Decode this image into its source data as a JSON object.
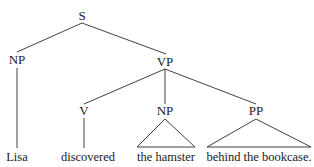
{
  "diagram": {
    "type": "syntax-tree",
    "sentence": "Lisa discovered the hamster behind the bookcase.",
    "background_color": "#ffffff",
    "line_color": "#2b2b2b",
    "text_color": "#1a1a1a"
  },
  "nodes": {
    "s": {
      "label": "S",
      "x": 82,
      "y": 20
    },
    "np_subject": {
      "label": "NP",
      "x": 17,
      "y": 64
    },
    "vp": {
      "label": "VP",
      "x": 165,
      "y": 66
    },
    "v": {
      "label": "V",
      "x": 84,
      "y": 115
    },
    "np_object": {
      "label": "NP",
      "x": 165,
      "y": 115
    },
    "pp": {
      "label": "PP",
      "x": 256,
      "y": 115
    }
  },
  "leaves": {
    "lisa": {
      "label": "Lisa",
      "x": 17,
      "y": 161
    },
    "discovered": {
      "label": "discovered",
      "x": 88,
      "y": 161
    },
    "the_hamster": {
      "label": "the hamster",
      "x": 166,
      "y": 161
    },
    "behind_the_bookcase": {
      "label": "behind the bookcase.",
      "x": 259,
      "y": 161
    }
  },
  "edges": [
    {
      "name": "s-to-np",
      "x1": 82,
      "y1": 23,
      "x2": 17,
      "y2": 52
    },
    {
      "name": "s-to-vp",
      "x1": 82,
      "y1": 23,
      "x2": 166,
      "y2": 54
    },
    {
      "name": "np-to-lisa",
      "x1": 17,
      "y1": 68,
      "x2": 17,
      "y2": 148
    },
    {
      "name": "vp-to-v",
      "x1": 165,
      "y1": 69,
      "x2": 84,
      "y2": 104
    },
    {
      "name": "vp-to-np",
      "x1": 165,
      "y1": 69,
      "x2": 165,
      "y2": 104
    },
    {
      "name": "vp-to-pp",
      "x1": 165,
      "y1": 69,
      "x2": 256,
      "y2": 104
    },
    {
      "name": "v-to-discovered",
      "x1": 84,
      "y1": 118,
      "x2": 84,
      "y2": 148
    }
  ],
  "triangles": [
    {
      "name": "np-object-triangle",
      "apex_x": 165,
      "apex_y": 119,
      "left_x": 137,
      "right_x": 195,
      "base_y": 147
    },
    {
      "name": "pp-triangle",
      "apex_x": 256,
      "apex_y": 119,
      "left_x": 207,
      "right_x": 311,
      "base_y": 147
    }
  ]
}
